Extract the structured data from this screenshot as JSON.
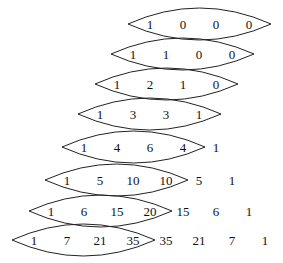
{
  "diagram": {
    "rows": [
      {
        "values": [
          "1",
          "0",
          "0",
          "0"
        ],
        "lens_count": 4
      },
      {
        "values": [
          "1",
          "1",
          "0",
          "0"
        ],
        "lens_count": 4
      },
      {
        "values": [
          "1",
          "2",
          "1",
          "0"
        ],
        "lens_count": 4
      },
      {
        "values": [
          "1",
          "3",
          "3",
          "1"
        ],
        "lens_count": 4
      },
      {
        "values": [
          "1",
          "4",
          "6",
          "4",
          "1"
        ],
        "lens_count": 4
      },
      {
        "values": [
          "1",
          "5",
          "10",
          "10",
          "5",
          "1"
        ],
        "lens_count": 4
      },
      {
        "values": [
          "1",
          "6",
          "15",
          "20",
          "15",
          "6",
          "1"
        ],
        "lens_count": 4
      },
      {
        "values": [
          "1",
          "7",
          "21",
          "35",
          "35",
          "21",
          "7",
          "1"
        ],
        "lens_count": 4
      }
    ]
  }
}
